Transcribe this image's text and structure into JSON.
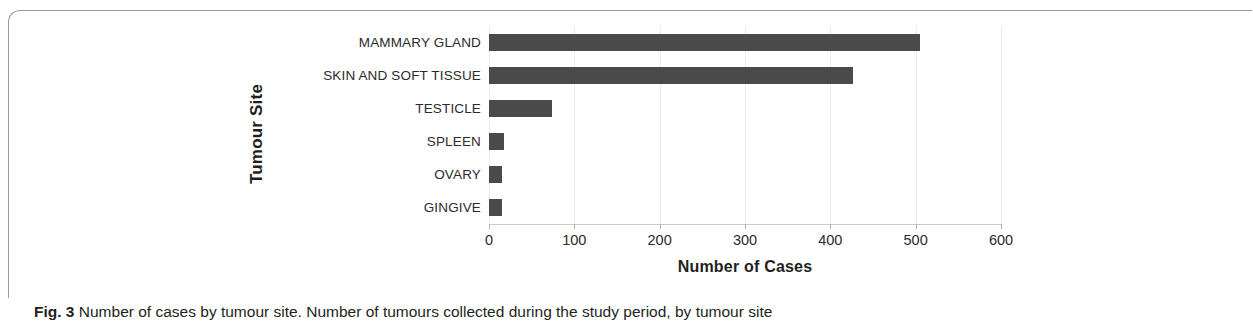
{
  "figure": {
    "caption_label": "Fig. 3",
    "caption_text": "Number of cases by tumour site. Number of tumours collected during the study period, by tumour site"
  },
  "chart_data": {
    "type": "bar",
    "orientation": "horizontal",
    "title": "",
    "xlabel": "Number of Cases",
    "ylabel": "Tumour Site",
    "categories": [
      "MAMMARY GLAND",
      "SKIN AND SOFT TISSUE",
      "TESTICLE",
      "SPLEEN",
      "OVARY",
      "GINGIVE"
    ],
    "values": [
      505,
      427,
      74,
      18,
      15,
      15
    ],
    "xlim": [
      0,
      600
    ],
    "xticks": [
      0,
      100,
      200,
      300,
      400,
      500,
      600
    ],
    "xtick_labels": [
      "0",
      "100",
      "200",
      "300",
      "400",
      "500",
      "600"
    ],
    "grid": true,
    "legend": false,
    "bar_color": "#4a4a4a",
    "gridline_color": "#ebebeb",
    "axis_color": "#c9c9c9"
  }
}
